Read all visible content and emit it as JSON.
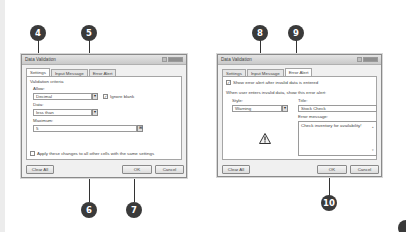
{
  "callouts": [
    "4",
    "5",
    "6",
    "7",
    "8",
    "9",
    "10"
  ],
  "left_dialog": {
    "title": "Data Validation",
    "tabs": [
      {
        "label": "Settings",
        "active": true
      },
      {
        "label": "Input Message",
        "active": false
      },
      {
        "label": "Error Alert",
        "active": false
      }
    ],
    "section_label": "Validation criteria",
    "allow_label": "Allow:",
    "allow_value": "Decimal",
    "ignore_blank_label": "Ignore blank",
    "ignore_blank_checked": true,
    "data_label": "Data:",
    "data_value": "less than",
    "maximum_label": "Maximum:",
    "maximum_value": "5",
    "apply_label": "Apply these changes to all other cells with the same settings",
    "apply_checked": false,
    "clear_all": "Clear All",
    "ok": "OK",
    "cancel": "Cancel"
  },
  "right_dialog": {
    "title": "Data Validation",
    "tabs": [
      {
        "label": "Settings",
        "active": false
      },
      {
        "label": "Input Message",
        "active": false
      },
      {
        "label": "Error Alert",
        "active": true
      }
    ],
    "show_alert_label": "Show error alert after invalid data is entered",
    "show_alert_checked": true,
    "instruction": "When user enters invalid data, show this error alert:",
    "style_label": "Style:",
    "style_value": "Warning",
    "title_label": "Title:",
    "title_value": "Stock Check",
    "error_message_label": "Error message:",
    "error_message_value": "Check inventory for availability!",
    "icon": "warning-icon",
    "clear_all": "Clear All",
    "ok": "OK",
    "cancel": "Cancel"
  },
  "icons": {
    "dropdown": "▾",
    "checkmark": "✓",
    "range_picker": "⊞",
    "scroll_up": "▴",
    "scroll_down": "▾"
  }
}
